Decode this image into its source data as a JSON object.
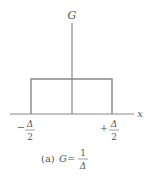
{
  "diagram": {
    "y_axis_label": "G",
    "x_axis_label": "x",
    "left_tick": {
      "sign": "−",
      "numerator": "Δ",
      "denominator": "2"
    },
    "right_tick": {
      "sign": "+",
      "numerator": "Δ",
      "denominator": "2"
    },
    "caption": {
      "prefix": "(a)",
      "variable": "G",
      "equals": "=",
      "numerator": "1",
      "denominator": "Δ"
    },
    "colors": {
      "line": "#888888",
      "text": "#555555",
      "background": "#ffffff"
    }
  }
}
